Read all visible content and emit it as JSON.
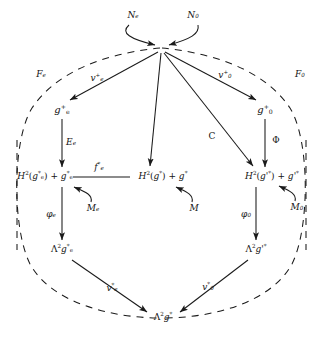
{
  "diagram": {
    "type": "commutative-diagram",
    "title": "",
    "regions": [
      {
        "id": "Fe",
        "label": "F_e",
        "label_html": "F<sub>e</sub>",
        "side": "left"
      },
      {
        "id": "F0",
        "label": "F_0",
        "label_html": "F<sub>0</sub>",
        "side": "right"
      }
    ],
    "nodes": [
      {
        "id": "apex",
        "label": "",
        "label_html": "",
        "x": 161,
        "y": 48
      },
      {
        "id": "ge+",
        "label": "g_e^+",
        "label_html": "<i class=\"v\">g</i><sup>+</sup><sub>e</sub>",
        "x": 62,
        "y": 110
      },
      {
        "id": "g0+",
        "label": "g_0^+",
        "label_html": "<i class=\"v\">g</i><sup>+</sup><sub>0</sub>",
        "x": 265,
        "y": 110
      },
      {
        "id": "H2ge",
        "label": "H^2(g_e^*) + g_e^*",
        "label_html": "<i class=\"v\">H</i><sup>2</sup>(<i class=\"v\">g</i><sup>*</sup><sub>e</sub>) + <i class=\"v\">g</i><sup>*</sup><sub>e</sub>",
        "x": 45,
        "y": 176
      },
      {
        "id": "H2g",
        "label": "H^2(g^*) + g^*",
        "label_html": "<i class=\"v\">H</i><sup>2</sup>(<i class=\"v\">g</i><sup>*</sup>) + <i class=\"v\">g</i><sup>*</sup>",
        "x": 163,
        "y": 176
      },
      {
        "id": "H2gp",
        "label": "H^2(g'^*) + g'^*",
        "label_html": "<i class=\"v\">H</i><sup>2</sup>(<i class=\"v\">g</i>'<sup>*</sup>) + <i class=\"v\">g</i>'<sup>*</sup>",
        "x": 272,
        "y": 176
      },
      {
        "id": "L2ge",
        "label": "Λ^2 g_e^*",
        "label_html": "Λ<sup>2</sup><i class=\"v\">g</i><sup>*</sup><sub>e</sub>",
        "x": 62,
        "y": 249
      },
      {
        "id": "L2gp",
        "label": "Λ^2 g'^*",
        "label_html": "Λ<sup>2</sup><i class=\"v\">g</i>'<sup>*</sup>",
        "x": 256,
        "y": 249
      },
      {
        "id": "L2g",
        "label": "Λ^2 g^*",
        "label_html": "Λ<sup>2</sup><i class=\"v\">g</i><sup>*</sup>",
        "x": 163,
        "y": 317
      }
    ],
    "edges": [
      {
        "id": "Ne",
        "from": "Ne-label",
        "to": "apex",
        "label": "N_e",
        "label_html": "<i class=\"v\">N</i><sub>e</sub>",
        "style": "curved"
      },
      {
        "id": "N0",
        "from": "N0-label",
        "to": "apex",
        "label": "N_0",
        "label_html": "<i class=\"v\">N</i><sub>0</sub>",
        "style": "curved"
      },
      {
        "id": "ve+",
        "from": "apex",
        "to": "ge+",
        "label": "v_e^+",
        "label_html": "<i class=\"v\">v</i><sup>+</sup><sub>e</sub>",
        "style": "straight"
      },
      {
        "id": "v0+",
        "from": "apex",
        "to": "g0+",
        "label": "v_0^+",
        "label_html": "<i class=\"v\">v</i><sup>+</sup><sub>0</sub>",
        "style": "straight"
      },
      {
        "id": "C",
        "from": "apex",
        "to": "H2gp",
        "label": "C",
        "label_html": "<span class=\"plain\">C</span>",
        "style": "straight"
      },
      {
        "id": "Ee",
        "from": "ge+",
        "to": "H2ge",
        "label": "E_e",
        "label_html": "<i class=\"v\">E</i><sub>e</sub>",
        "style": "straight"
      },
      {
        "id": "Phi",
        "from": "g0+",
        "to": "H2gp",
        "label": "Φ",
        "label_html": "<span class=\"plain\">Φ</span>",
        "style": "straight"
      },
      {
        "id": "fe*",
        "from": "H2ge",
        "to": "H2g",
        "label": "f_e^*",
        "label_html": "<i class=\"v\">f</i><sup>*</sup><sub>e</sub>",
        "style": "line"
      },
      {
        "id": "Me",
        "from": "Me-label",
        "to": "H2ge",
        "label": "M_e",
        "label_html": "<i class=\"v\">M</i><sub>e</sub>",
        "style": "curved"
      },
      {
        "id": "M",
        "from": "M-label",
        "to": "H2g",
        "label": "M",
        "label_html": "<i class=\"v\">M</i>",
        "style": "curved"
      },
      {
        "id": "M0",
        "from": "M0-label",
        "to": "H2gp",
        "label": "M_0",
        "label_html": "<i class=\"v\">M</i><sub>0</sub>",
        "style": "curved"
      },
      {
        "id": "phie",
        "from": "H2ge",
        "to": "L2ge",
        "label": "φ_e",
        "label_html": "<i class=\"v\">φ</i><sub>e</sub>",
        "style": "straight"
      },
      {
        "id": "phi0",
        "from": "H2gp",
        "to": "L2gp",
        "label": "φ_0",
        "label_html": "<i class=\"v\">φ</i><sub>0</sub>",
        "style": "straight"
      },
      {
        "id": "ve*",
        "from": "L2ge",
        "to": "L2g",
        "label": "v_e^*",
        "label_html": "<i class=\"v\">v</i><sup>*</sup><sub>e</sub>",
        "style": "straight"
      },
      {
        "id": "v0*",
        "from": "L2gp",
        "to": "L2g",
        "label": "v_0^*",
        "label_html": "<i class=\"v\">v</i><sup>*</sup><sub>0</sub>",
        "style": "straight"
      }
    ],
    "edge_labels": [
      {
        "id": "Ne-label",
        "label": "N_e",
        "label_html": "<i class=\"v\">N</i><sub>e</sub>",
        "x": 133,
        "y": 15
      },
      {
        "id": "N0-label",
        "label": "N_0",
        "label_html": "<i class=\"v\">N</i><sub>0</sub>",
        "x": 193,
        "y": 15
      },
      {
        "id": "Fe-label",
        "label": "F_e",
        "label_html": "<i class=\"v\">F</i><sub>e</sub>",
        "x": 41,
        "y": 74
      },
      {
        "id": "F0-label",
        "label": "F_0",
        "label_html": "<i class=\"v\">F</i><sub>0</sub>",
        "x": 300,
        "y": 74
      },
      {
        "id": "ve+-label",
        "label": "v_e^+",
        "label_html": "<i class=\"v\">v</i><sup>+</sup><sub>e</sub>",
        "x": 97,
        "y": 78
      },
      {
        "id": "v0+-label",
        "label": "v_0^+",
        "label_html": "<i class=\"v\">v</i><sup>+</sup><sub>0</sub>",
        "x": 225,
        "y": 75
      },
      {
        "id": "C-label",
        "label": "C",
        "label_html": "<span class=\"plain\">C</span>",
        "x": 212,
        "y": 136
      },
      {
        "id": "Ee-label",
        "label": "E_e",
        "label_html": "<i class=\"v\">E</i><sub>e</sub>",
        "x": 71,
        "y": 142
      },
      {
        "id": "Phi-label",
        "label": "Φ",
        "label_html": "<span class=\"plain\">Φ</span>",
        "x": 276,
        "y": 140
      },
      {
        "id": "fe*-label",
        "label": "f_e^*",
        "label_html": "<i class=\"v\">f</i><sup>*</sup><sub>e</sub>",
        "x": 99,
        "y": 167
      },
      {
        "id": "Me-label",
        "label": "M_e",
        "label_html": "<i class=\"v\">M</i><sub>e</sub>",
        "x": 93,
        "y": 208
      },
      {
        "id": "M-label",
        "label": "M",
        "label_html": "<i class=\"v\">M</i>",
        "x": 194,
        "y": 208
      },
      {
        "id": "M0-label",
        "label": "M_0",
        "label_html": "<i class=\"v\">M</i><sub>0</sub>",
        "x": 297,
        "y": 207
      },
      {
        "id": "phie-label",
        "label": "φ_e",
        "label_html": "<i class=\"v\">φ</i><sub>e</sub>",
        "x": 51,
        "y": 214
      },
      {
        "id": "phi0-label",
        "label": "φ_0",
        "label_html": "<i class=\"v\">φ</i><sub>0</sub>",
        "x": 246,
        "y": 214
      },
      {
        "id": "ve*-label",
        "label": "v_e^*",
        "label_html": "<i class=\"v\">v</i><sup>*</sup><sub>e</sub>",
        "x": 112,
        "y": 288
      },
      {
        "id": "v0*-label",
        "label": "v_0^*",
        "label_html": "<i class=\"v\">v</i><sup>*</sup><sub>0</sub>",
        "x": 208,
        "y": 287
      }
    ],
    "colors": {
      "stroke": "#1a1a1a",
      "background": "#ffffff",
      "dashed": "#1a1a1a"
    }
  }
}
